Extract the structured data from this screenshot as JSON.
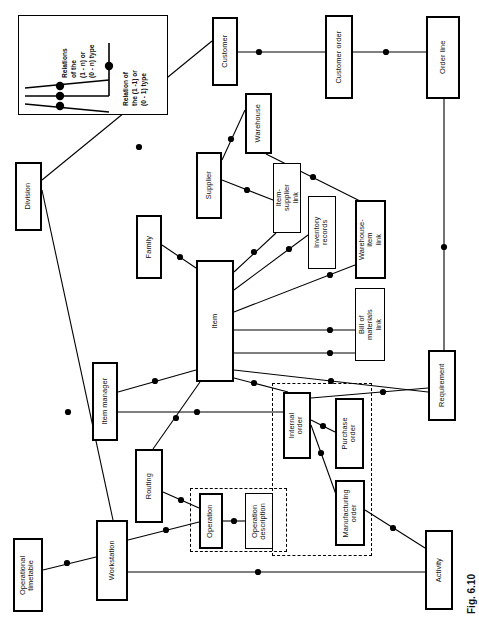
{
  "figure": {
    "caption": "Fig. 6.10",
    "legend": {
      "many_label": "Relations of the (1 - n) or (0 - n) type",
      "many_lines": [
        "Relations",
        "of the",
        "(1 - n) or",
        "(0 - n) type"
      ],
      "one_label": "Relation of the (1 -1) or (0 - 1) type",
      "one_lines": [
        "Relation of",
        "the (1 -1) or",
        "(0 - 1) type"
      ]
    },
    "colors": {
      "line": "#000000",
      "box_fill": "#ffffff",
      "dot": "#000000"
    }
  },
  "entities": [
    {
      "id": "customer",
      "label": "Customer",
      "x": 212,
      "y": 17,
      "w": 26,
      "h": 69,
      "thick": true,
      "lines": [
        "Customer"
      ]
    },
    {
      "id": "customer_order",
      "label": "Customer order",
      "x": 325,
      "y": 15,
      "w": 28,
      "h": 84,
      "thick": true,
      "lines": [
        "Customer order"
      ]
    },
    {
      "id": "order_line",
      "label": "Order line",
      "x": 426,
      "y": 16,
      "w": 34,
      "h": 83,
      "thick": true,
      "lines": [
        "Order line"
      ]
    },
    {
      "id": "warehouse",
      "label": "Warehouse",
      "x": 245,
      "y": 93,
      "w": 27,
      "h": 61,
      "thick": true,
      "lines": [
        "Warehouse"
      ]
    },
    {
      "id": "division",
      "label": "Division",
      "x": 15,
      "y": 162,
      "w": 27,
      "h": 69,
      "thick": true,
      "lines": [
        "Division"
      ]
    },
    {
      "id": "supplier",
      "label": "Supplier",
      "x": 196,
      "y": 152,
      "w": 26,
      "h": 67,
      "thick": true,
      "lines": [
        "Supplier"
      ]
    },
    {
      "id": "item_supplier_link",
      "label": "Item-supplier link",
      "x": 273,
      "y": 163,
      "w": 28,
      "h": 70,
      "thick": false,
      "lines": [
        "Item-supplier",
        "link"
      ]
    },
    {
      "id": "family",
      "label": "Family",
      "x": 136,
      "y": 215,
      "w": 26,
      "h": 64,
      "thick": true,
      "lines": [
        "Family"
      ]
    },
    {
      "id": "inventory_records",
      "label": "Inventory records",
      "x": 308,
      "y": 196,
      "w": 28,
      "h": 73,
      "thick": false,
      "lines": [
        "Inventory",
        "records"
      ]
    },
    {
      "id": "warehouse_item_link",
      "label": "Warehouse-item link",
      "x": 355,
      "y": 200,
      "w": 31,
      "h": 79,
      "thick": true,
      "lines": [
        "Warehouse-item",
        "link"
      ]
    },
    {
      "id": "item",
      "label": "Item",
      "x": 196,
      "y": 260,
      "w": 38,
      "h": 122,
      "thick": true,
      "lines": [
        "Item"
      ]
    },
    {
      "id": "bill_of_materials",
      "label": "Bill of materials link",
      "x": 355,
      "y": 288,
      "w": 30,
      "h": 73,
      "thick": false,
      "lines": [
        "Bill of",
        "materials link"
      ]
    },
    {
      "id": "requirement",
      "label": "Requirement",
      "x": 428,
      "y": 350,
      "w": 28,
      "h": 71,
      "thick": true,
      "lines": [
        "Requirement"
      ]
    },
    {
      "id": "item_manager",
      "label": "Item manager",
      "x": 92,
      "y": 362,
      "w": 26,
      "h": 79,
      "thick": true,
      "lines": [
        "Item manager"
      ]
    },
    {
      "id": "internal_order",
      "label": "Internal order",
      "x": 283,
      "y": 392,
      "w": 28,
      "h": 67,
      "thick": true,
      "lines": [
        "Internal",
        "order"
      ]
    },
    {
      "id": "purchase_order",
      "label": "Purchase order",
      "x": 335,
      "y": 398,
      "w": 29,
      "h": 71,
      "thick": true,
      "lines": [
        "Purchase",
        "order"
      ]
    },
    {
      "id": "routing",
      "label": "Routing",
      "x": 135,
      "y": 449,
      "w": 28,
      "h": 74,
      "thick": true,
      "lines": [
        "Routing"
      ]
    },
    {
      "id": "manufacturing_order",
      "label": "Manufacturing order",
      "x": 335,
      "y": 480,
      "w": 30,
      "h": 66,
      "thick": true,
      "lines": [
        "Manufacturing",
        "order"
      ]
    },
    {
      "id": "operation",
      "label": "Operation",
      "x": 199,
      "y": 493,
      "w": 24,
      "h": 56,
      "thick": true,
      "lines": [
        "Operation"
      ]
    },
    {
      "id": "operation_desc",
      "label": "Operation description",
      "x": 245,
      "y": 493,
      "w": 28,
      "h": 56,
      "thick": false,
      "lines": [
        "Operation",
        "description"
      ]
    },
    {
      "id": "workstation",
      "label": "Workstation",
      "x": 96,
      "y": 520,
      "w": 32,
      "h": 81,
      "thick": true,
      "lines": [
        "Workstation"
      ]
    },
    {
      "id": "operational_timetable",
      "label": "Operational timetable",
      "x": 13,
      "y": 538,
      "w": 30,
      "h": 74,
      "thick": true,
      "lines": [
        "Operational",
        "timetable"
      ]
    },
    {
      "id": "activity",
      "label": "Activity",
      "x": 425,
      "y": 530,
      "w": 28,
      "h": 80,
      "thick": true,
      "lines": [
        "Activity"
      ]
    }
  ],
  "groups": [
    {
      "id": "orders-group",
      "label": "orders grouping",
      "x": 272,
      "y": 383,
      "w": 100,
      "h": 173
    },
    {
      "id": "operation-group",
      "label": "operation grouping",
      "x": 190,
      "y": 488,
      "w": 97,
      "h": 64
    }
  ],
  "relations": [
    {
      "from": "customer",
      "to": "customer_order",
      "x1": 238,
      "y1": 52,
      "x2": 325,
      "y2": 52,
      "dot": [
        259,
        52
      ],
      "kind": "one"
    },
    {
      "from": "customer_order",
      "to": "order_line",
      "x1": 353,
      "y1": 52,
      "x2": 426,
      "y2": 52,
      "dot": [
        386,
        52
      ],
      "kind": "one"
    },
    {
      "from": "order_line",
      "to": "requirement",
      "x1": 444,
      "y1": 99,
      "x2": 444,
      "y2": 350,
      "dot": [
        444,
        247
      ],
      "kind": "many"
    },
    {
      "from": "division",
      "to": "customer",
      "x1": 42,
      "y1": 180,
      "x2": 212,
      "y2": 41,
      "dot": [
        139,
        147
      ],
      "kind": "many"
    },
    {
      "from": "division",
      "to": "workstation",
      "x1": 42,
      "y1": 190,
      "x2": 113,
      "y2": 520,
      "dot": [
        68,
        412
      ],
      "kind": "many"
    },
    {
      "from": "warehouse",
      "to": "supplier",
      "x1": 245,
      "y1": 110,
      "x2": 222,
      "y2": 160,
      "dot": [
        231,
        139
      ],
      "kind": "many"
    },
    {
      "from": "warehouse",
      "to": "warehouse_item_link",
      "x1": 266,
      "y1": 154,
      "x2": 360,
      "y2": 201,
      "dot": [
        313,
        177
      ],
      "kind": "many"
    },
    {
      "from": "supplier",
      "to": "item_supplier_link",
      "x1": 222,
      "y1": 180,
      "x2": 273,
      "y2": 200,
      "dot": [
        247,
        190
      ],
      "kind": "many"
    },
    {
      "from": "item",
      "to": "item_supplier_link",
      "x1": 234,
      "y1": 272,
      "x2": 276,
      "y2": 233,
      "dot": [
        254,
        252
      ],
      "kind": "many"
    },
    {
      "from": "item",
      "to": "inventory_records",
      "x1": 234,
      "y1": 290,
      "x2": 308,
      "y2": 235,
      "dot": [
        289,
        249
      ],
      "kind": "many"
    },
    {
      "from": "item",
      "to": "warehouse_item_link",
      "x1": 234,
      "y1": 312,
      "x2": 355,
      "y2": 265,
      "dot": [
        330,
        275
      ],
      "kind": "many"
    },
    {
      "from": "item",
      "to": "bill_of_materials_1",
      "x1": 234,
      "y1": 330,
      "x2": 355,
      "y2": 330,
      "dot": [
        330,
        330
      ],
      "kind": "many"
    },
    {
      "from": "item",
      "to": "bill_of_materials_2",
      "x1": 234,
      "y1": 353,
      "x2": 355,
      "y2": 353,
      "dot": [
        330,
        353
      ],
      "kind": "many"
    },
    {
      "from": "item",
      "to": "requirement",
      "x1": 234,
      "y1": 370,
      "x2": 428,
      "y2": 392,
      "dot": [
        331,
        381
      ],
      "kind": "many"
    },
    {
      "from": "item",
      "to": "internal_order",
      "x1": 234,
      "y1": 378,
      "x2": 288,
      "y2": 392,
      "dot": [
        254,
        383
      ],
      "kind": "many"
    },
    {
      "from": "family",
      "to": "item",
      "x1": 162,
      "y1": 245,
      "x2": 196,
      "y2": 268,
      "dot": [
        180,
        257
      ],
      "kind": "many"
    },
    {
      "from": "item",
      "to": "item_manager",
      "x1": 196,
      "y1": 370,
      "x2": 118,
      "y2": 392,
      "dot": [
        155,
        381
      ],
      "kind": "many"
    },
    {
      "from": "item_manager",
      "to": "internal_order",
      "x1": 118,
      "y1": 412,
      "x2": 283,
      "y2": 412,
      "dot": [
        197,
        412
      ],
      "kind": "many"
    },
    {
      "from": "item",
      "to": "routing",
      "x1": 200,
      "y1": 382,
      "x2": 153,
      "y2": 449,
      "dot": [
        176,
        418
      ],
      "kind": "many"
    },
    {
      "from": "routing",
      "to": "operation",
      "x1": 163,
      "y1": 492,
      "x2": 199,
      "y2": 508,
      "dot": [
        181,
        500
      ],
      "kind": "many"
    },
    {
      "from": "workstation",
      "to": "operation",
      "x1": 128,
      "y1": 540,
      "x2": 199,
      "y2": 522,
      "dot": [
        166,
        530
      ],
      "kind": "many"
    },
    {
      "from": "operation",
      "to": "operation_desc",
      "x1": 223,
      "y1": 521,
      "x2": 245,
      "y2": 521,
      "dot": [
        234,
        521
      ],
      "kind": "one"
    },
    {
      "from": "internal_order",
      "to": "purchase_order",
      "x1": 311,
      "y1": 420,
      "x2": 335,
      "y2": 432,
      "dot": [
        323,
        426
      ],
      "kind": "many"
    },
    {
      "from": "internal_order",
      "to": "manufacturing_order",
      "x1": 311,
      "y1": 425,
      "x2": 338,
      "y2": 500,
      "dot": [
        321,
        453
      ],
      "kind": "many"
    },
    {
      "from": "internal_order",
      "to": "requirement",
      "x1": 311,
      "y1": 398,
      "x2": 428,
      "y2": 388,
      "dot": [
        383,
        392
      ],
      "kind": "many"
    },
    {
      "from": "manufacturing_order",
      "to": "activity",
      "x1": 365,
      "y1": 510,
      "x2": 425,
      "y2": 548,
      "dot": [
        393,
        528
      ],
      "kind": "many"
    },
    {
      "from": "workstation",
      "to": "activity",
      "x1": 128,
      "y1": 572,
      "x2": 425,
      "y2": 572,
      "dot": [
        258,
        572
      ],
      "kind": "many"
    },
    {
      "from": "operational_timetable",
      "to": "workstation",
      "x1": 43,
      "y1": 570,
      "x2": 96,
      "y2": 557,
      "dot": [
        67,
        563
      ],
      "kind": "many"
    }
  ]
}
